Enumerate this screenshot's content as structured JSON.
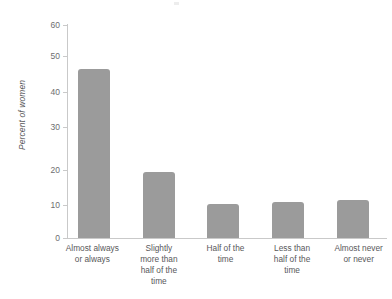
{
  "chart_data": {
    "type": "bar",
    "title": "",
    "subtitle": "",
    "xlabel": "",
    "ylabel": "Percent of women",
    "ylim": [
      0,
      60
    ],
    "yticks": [
      "0",
      "10",
      "20",
      "30",
      "40",
      "50",
      "60"
    ],
    "grid": false,
    "legend": "none",
    "bar_color": "#9b9b9b",
    "axis_color": "#c9c9c9",
    "text_color": "#58585a",
    "categories": [
      "Almost always or always",
      "Slightly more than half of the time",
      "Half of the time",
      "Less than half of the time",
      "Almost never or never"
    ],
    "category_lines": [
      [
        "Almost always",
        "or always"
      ],
      [
        "Slightly",
        "more than",
        "half of the",
        "time"
      ],
      [
        "Half of the",
        "time"
      ],
      [
        "Less than",
        "half of the",
        "time"
      ],
      [
        "Almost never",
        "or never"
      ]
    ],
    "values": [
      47.5,
      18.7,
      9.7,
      10.2,
      10.7
    ]
  },
  "axis": {
    "y_title": "Percent of women",
    "tick_0": "0",
    "tick_10": "10",
    "tick_20": "20",
    "tick_30": "30",
    "tick_40": "40",
    "tick_50": "50",
    "tick_60": "60"
  },
  "categories": {
    "cat0_line0": "Almost always",
    "cat0_line1": "or always",
    "cat1_line0": "Slightly",
    "cat1_line1": "more than",
    "cat1_line2": "half of the",
    "cat1_line3": "time",
    "cat2_line0": "Half of the",
    "cat2_line1": "time",
    "cat3_line0": "Less than",
    "cat3_line1": "half of the",
    "cat3_line2": "time",
    "cat4_line0": "Almost never",
    "cat4_line1": "or never"
  }
}
